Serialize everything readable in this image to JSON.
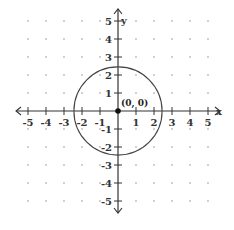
{
  "chart_data": {
    "type": "scatter",
    "title": "",
    "xlabel": "x",
    "ylabel": "y",
    "xlim": [
      -5,
      5
    ],
    "ylim": [
      -5,
      5
    ],
    "grid": "dots at integer lattice points",
    "x_ticks": [
      -5,
      -4,
      -3,
      -2,
      -1,
      1,
      2,
      3,
      4,
      5
    ],
    "y_ticks": [
      -5,
      -4,
      -3,
      -2,
      -1,
      1,
      2,
      3,
      4,
      5
    ],
    "x_tick_labels": [
      "-5",
      "-4",
      "-3",
      "-2",
      "-1",
      "1",
      "2",
      "3",
      "4",
      "5"
    ],
    "y_tick_labels": [
      "-5",
      "-4",
      "-3",
      "-2",
      "-1",
      "1",
      "2",
      "3",
      "4",
      "5"
    ],
    "shapes": [
      {
        "kind": "circle",
        "center": [
          0,
          0
        ],
        "radius": 2.45
      }
    ],
    "points": [
      {
        "x": 0,
        "y": 0,
        "label": "(0, 0)"
      }
    ]
  },
  "layout": {
    "origin_px": [
      118,
      111
    ],
    "unit_px": 18,
    "colors": {
      "axis": "#333333",
      "circle": "#444444",
      "grid_dot": "#bbbbbb",
      "point": "#111111"
    }
  }
}
